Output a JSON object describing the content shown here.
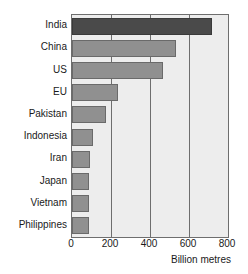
{
  "chart_data": {
    "type": "bar",
    "orientation": "horizontal",
    "title": "",
    "xlabel": "Billion metres",
    "ylabel": "",
    "categories": [
      "India",
      "China",
      "US",
      "EU",
      "Pakistan",
      "Indonesia",
      "Iran",
      "Japan",
      "Vietnam",
      "Philippines"
    ],
    "values": [
      720,
      535,
      465,
      235,
      175,
      110,
      90,
      85,
      85,
      85
    ],
    "xlim": [
      0,
      800
    ],
    "xticks": [
      0,
      200,
      400,
      600,
      800
    ],
    "xtick_labels": [
      "0",
      "200",
      "400",
      "600",
      "800"
    ],
    "grid": "vertical",
    "legend": "none",
    "highlight_category": "India",
    "colors": {
      "bar": "#909090",
      "bar_highlight": "#4a4a4a",
      "bar_edge": "#6a6a6a",
      "plot_background": "#ededed",
      "gridline": "#6e6e6e",
      "axis": "#6e6e6e",
      "text": "#1a1a1a",
      "page_background": "#ffffff"
    }
  }
}
